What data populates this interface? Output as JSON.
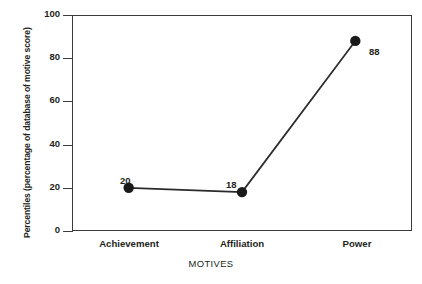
{
  "chart_data": {
    "type": "line",
    "title": "",
    "categories": [
      "Achievement",
      "Affiliation",
      "Power"
    ],
    "values": [
      20,
      18,
      88
    ],
    "point_labels": [
      "20",
      "18",
      "88"
    ],
    "xlabel": "MOTIVES",
    "ylabel": "Percentiles (percentage of database of motive score)",
    "ylim": [
      0,
      100
    ],
    "yticks": [
      "0",
      "20",
      "40",
      "60",
      "80",
      "100"
    ],
    "ytick_values": [
      0,
      20,
      40,
      60,
      80,
      100
    ],
    "grid": false,
    "legend": "none",
    "series": [
      {
        "name": "Motive percentile",
        "values": [
          20,
          18,
          88
        ]
      }
    ],
    "colors": {
      "line": "#2b2b2d",
      "marker": "#1a1a1a",
      "frame": "#3b3b3d",
      "text": "#231f20",
      "background": "#ffffff"
    }
  }
}
